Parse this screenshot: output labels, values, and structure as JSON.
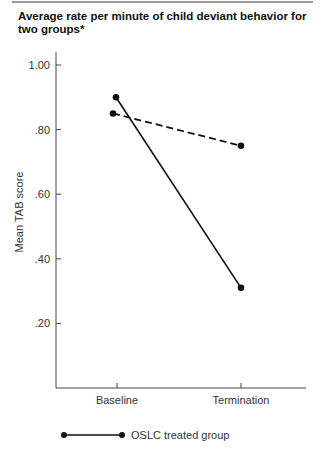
{
  "title": "Average rate per minute of child deviant behavior for two groups*",
  "chart_data": {
    "type": "line",
    "title": "Average rate per minute of child deviant behavior for two groups*",
    "xlabel": "",
    "ylabel": "Mean TAB score",
    "categories": [
      "Baseline",
      "Termination"
    ],
    "series": [
      {
        "name": "OSLC treated group",
        "style": "solid",
        "values": [
          0.9,
          0.31
        ]
      },
      {
        "name": "",
        "style": "dashed",
        "values": [
          0.85,
          0.75
        ]
      }
    ],
    "yticks": [
      1.0,
      0.8,
      0.6,
      0.4,
      0.2
    ],
    "ytick_labels": [
      "1.00",
      ".80",
      ".60",
      ".40",
      ".20"
    ],
    "ylim": [
      0,
      1.05
    ],
    "grid": false,
    "legend_position": "bottom"
  },
  "legend": {
    "items": [
      {
        "label": "OSLC treated group",
        "style": "solid"
      }
    ]
  },
  "colors": {
    "line": "#111111",
    "axis": "#444444",
    "rule": "#9a9a9a"
  }
}
